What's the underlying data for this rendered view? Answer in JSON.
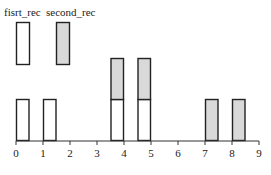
{
  "chart_data": {
    "type": "bar",
    "title": "",
    "xlabel": "",
    "ylabel": "",
    "xlim": [
      0,
      9
    ],
    "xticks": [
      0,
      1,
      2,
      3,
      4,
      5,
      6,
      7,
      8,
      9
    ],
    "grid": false,
    "legend_position": "top-left",
    "bar_width": 0.5,
    "series": [
      {
        "name": "fisrt_rec",
        "color": "#ffffff",
        "edge_color": "#222222",
        "bars": [
          {
            "x_start": 0.0,
            "x_end": 0.5,
            "bottom": 0,
            "height": 1
          },
          {
            "x_start": 1.0,
            "x_end": 1.5,
            "bottom": 0,
            "height": 1
          },
          {
            "x_start": 3.5,
            "x_end": 4.0,
            "bottom": 0,
            "height": 1
          },
          {
            "x_start": 4.5,
            "x_end": 5.0,
            "bottom": 0,
            "height": 1
          }
        ]
      },
      {
        "name": "second_rec",
        "color": "#d9d9d9",
        "edge_color": "#222222",
        "bars": [
          {
            "x_start": 3.5,
            "x_end": 4.0,
            "bottom": 1,
            "height": 1
          },
          {
            "x_start": 4.5,
            "x_end": 5.0,
            "bottom": 1,
            "height": 1
          },
          {
            "x_start": 7.0,
            "x_end": 7.5,
            "bottom": 0,
            "height": 1
          },
          {
            "x_start": 8.0,
            "x_end": 8.5,
            "bottom": 0,
            "height": 1
          }
        ]
      }
    ]
  },
  "legend": [
    {
      "label": "fisrt_rec",
      "color": "#ffffff"
    },
    {
      "label": "second_rec",
      "color": "#d9d9d9"
    }
  ],
  "axis": {
    "tick_labels": [
      "0",
      "1",
      "2",
      "3",
      "4",
      "5",
      "6",
      "7",
      "8",
      "9"
    ]
  }
}
